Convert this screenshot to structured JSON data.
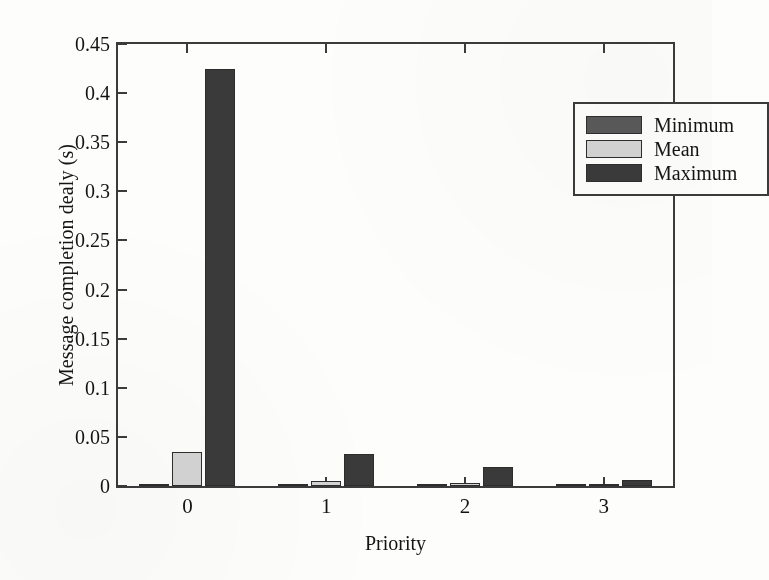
{
  "chart_data": {
    "type": "bar",
    "title": "",
    "xlabel": "Priority",
    "ylabel": "Message completion dealy (s)",
    "categories": [
      "0",
      "1",
      "2",
      "3"
    ],
    "series": [
      {
        "name": "Minimum",
        "color": "#595959",
        "values": [
          0.0012,
          0.0015,
          0.0008,
          0.0008
        ]
      },
      {
        "name": "Mean",
        "color": "#d4d4d4",
        "values": [
          0.035,
          0.0055,
          0.003,
          0.0022
        ]
      },
      {
        "name": "Maximum",
        "color": "#3a3a3a",
        "values": [
          0.425,
          0.0325,
          0.0195,
          0.006
        ]
      }
    ],
    "ylim": [
      0,
      0.45
    ],
    "ytick_labels": [
      "0",
      "0.05",
      "0.1",
      "0.15",
      "0.2",
      "0.25",
      "0.3",
      "0.35",
      "0.4",
      "0.45"
    ],
    "ytick_values": [
      0,
      0.05,
      0.1,
      0.15,
      0.2,
      0.25,
      0.3,
      0.35,
      0.4,
      0.45
    ],
    "grid": false,
    "legend_position": "upper right",
    "legend_entries": [
      "Minimum",
      "Mean",
      "Maximum"
    ]
  },
  "axis_color": "#3b3b3b",
  "background_color": "#fdfdfb"
}
